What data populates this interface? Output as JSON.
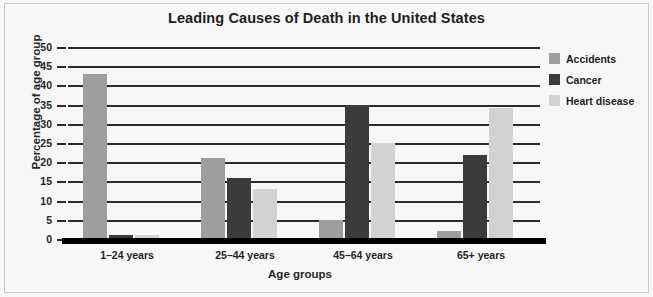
{
  "chart_data": {
    "type": "bar",
    "title": "Leading Causes of Death in the United States",
    "xlabel": "Age groups",
    "ylabel": "Percentage of age group",
    "categories": [
      "1–24 years",
      "25–44 years",
      "45–64 years",
      "65+ years"
    ],
    "series": [
      {
        "name": "Accidents",
        "color": "#9e9e9e",
        "values": [
          43,
          21,
          5,
          2
        ]
      },
      {
        "name": "Cancer",
        "color": "#3b3b3b",
        "values": [
          1,
          16,
          35,
          22
        ]
      },
      {
        "name": "Heart disease",
        "color": "#d2d2d2",
        "values": [
          1,
          13,
          25,
          34
        ]
      }
    ],
    "ylim": [
      0,
      50
    ],
    "yticks": [
      50,
      45,
      40,
      35,
      30,
      25,
      20,
      15,
      10,
      5,
      0
    ],
    "ytick_labels": [
      "50",
      "45",
      "40",
      "35",
      "30",
      "25",
      "20",
      "15",
      "10",
      "5",
      "0"
    ],
    "grid": true,
    "legend_position": "right",
    "legend_entries": [
      "Accidents",
      "Cancer",
      "Heart disease"
    ]
  }
}
